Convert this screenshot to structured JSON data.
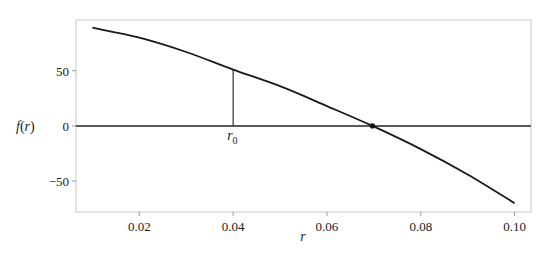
{
  "chart_data": {
    "type": "line",
    "title": "",
    "xlabel": "r",
    "ylabel": "f(r)",
    "xlim": [
      0.0065,
      0.1035
    ],
    "ylim": [
      -78,
      96
    ],
    "grid": false,
    "legend": null,
    "x_ticks": [
      0.02,
      0.04,
      0.06,
      0.08,
      0.1
    ],
    "x_tick_labels": [
      "0.02",
      "0.04",
      "0.06",
      "0.08",
      "0.10"
    ],
    "y_ticks": [
      -50,
      0,
      50
    ],
    "y_tick_labels": [
      "−50",
      "0",
      "50"
    ],
    "series": [
      {
        "name": "f(r)",
        "x": [
          0.01,
          0.02,
          0.03,
          0.04,
          0.05,
          0.06,
          0.0697,
          0.08,
          0.09,
          0.1
        ],
        "values": [
          89,
          80,
          67,
          51,
          36,
          18,
          0,
          -21,
          -44,
          -70
        ],
        "color": "#1a1a1a"
      }
    ],
    "annotations": [
      {
        "type": "hline",
        "y": 0,
        "label": "",
        "color": "#1a1a1a"
      },
      {
        "type": "vline-segment",
        "x": 0.04,
        "y0": 0,
        "y1": 51,
        "label": "r_0",
        "color": "#1a1a1a"
      },
      {
        "type": "point",
        "x": 0.0697,
        "y": 0,
        "label": "root",
        "color": "#1a1a1a"
      }
    ]
  },
  "labels": {
    "xlabel": "r",
    "ylabel_f": "f",
    "ylabel_paren_open": "(",
    "ylabel_r": "r",
    "ylabel_paren_close": ")",
    "r0_main": "r",
    "r0_sub": "0"
  }
}
